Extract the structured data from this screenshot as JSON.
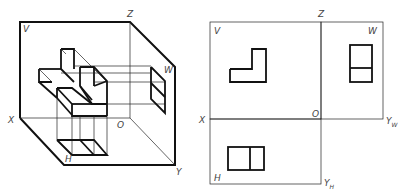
{
  "figure": {
    "left_panel": {
      "name": "pictorial-projection-box",
      "labels": {
        "V": "V",
        "W": "W",
        "H": "H",
        "X": "X",
        "Y": "Y",
        "Z": "Z",
        "O": "O"
      }
    },
    "right_panel": {
      "name": "unfolded-three-views",
      "labels": {
        "V": "V",
        "W": "W",
        "H": "H",
        "X": "X",
        "Z": "Z",
        "O": "O",
        "Y_W": "Y",
        "Y_W_sub": "W",
        "Y_H": "Y",
        "Y_H_sub": "H"
      },
      "views": {
        "front_view": "L-shaped outline",
        "side_view": "rectangle split horizontally",
        "top_view": "rectangle split vertically"
      }
    },
    "colors": {
      "line": "#111111",
      "label": "#444444",
      "background": "#ffffff"
    }
  }
}
